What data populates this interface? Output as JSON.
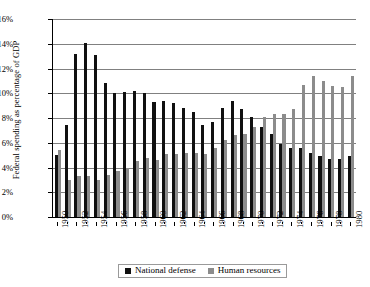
{
  "chart_data": {
    "type": "bar",
    "title": "",
    "xlabel": "",
    "ylabel": "Federal spending as percentage of GDP",
    "ylim": [
      0,
      16
    ],
    "ytick_labels": [
      "0%",
      "2%",
      "4%",
      "6%",
      "8%",
      "10%",
      "12%",
      "14%",
      "16%"
    ],
    "ytick_values": [
      0,
      2,
      4,
      6,
      8,
      10,
      12,
      14,
      16
    ],
    "grid": true,
    "legend_position": "bottom",
    "categories": [
      1950,
      1951,
      1952,
      1953,
      1954,
      1955,
      1956,
      1957,
      1958,
      1959,
      1960,
      1961,
      1962,
      1963,
      1964,
      1965,
      1966,
      1967,
      1968,
      1969,
      1970,
      1971,
      1972,
      1973,
      1974,
      1975,
      1976,
      1977,
      1978,
      1979,
      1980
    ],
    "xtick_labels": [
      "1950",
      "1952",
      "1954",
      "1956",
      "1958",
      "1960",
      "1962",
      "1964",
      "1966",
      "1968",
      "1970",
      "1972",
      "1974",
      "1976",
      "1978",
      "1980"
    ],
    "series": [
      {
        "name": "National defense",
        "color": "#101010",
        "values": [
          5.0,
          7.4,
          13.2,
          14.1,
          13.1,
          10.8,
          10.0,
          10.1,
          10.2,
          10.0,
          9.3,
          9.4,
          9.2,
          8.8,
          8.5,
          7.4,
          7.7,
          8.8,
          9.4,
          8.7,
          8.1,
          7.3,
          6.7,
          5.9,
          5.6,
          5.6,
          5.2,
          4.9,
          4.7,
          4.7,
          4.9
        ]
      },
      {
        "name": "Human resources",
        "color": "#8c8c8c",
        "values": [
          5.4,
          3.0,
          3.3,
          3.3,
          3.0,
          3.4,
          3.7,
          4.0,
          4.5,
          4.8,
          4.6,
          5.1,
          5.1,
          5.2,
          5.2,
          5.1,
          5.6,
          6.2,
          6.6,
          6.7,
          7.3,
          8.1,
          8.3,
          8.3,
          8.7,
          10.7,
          11.4,
          11.0,
          10.6,
          10.5,
          11.4
        ]
      }
    ]
  },
  "legend": {
    "entries": [
      {
        "label": "National defense",
        "swatch": "defense-swatch"
      },
      {
        "label": "Human resources",
        "swatch": "human-swatch"
      }
    ]
  }
}
